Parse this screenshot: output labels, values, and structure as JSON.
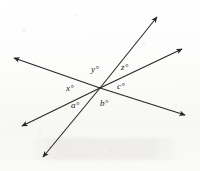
{
  "figure": {
    "background_color": "#fdfdfc",
    "line_color": "#262626",
    "label_color": "#1a1a1a",
    "width": 200,
    "height": 171,
    "vertex": {
      "x": 100,
      "y": 88
    }
  },
  "labels": [
    {
      "id": "x",
      "text": "x°",
      "x": 66,
      "y": 84
    },
    {
      "id": "y",
      "text": "y°",
      "x": 91,
      "y": 65
    },
    {
      "id": "z",
      "text": "z°",
      "x": 121,
      "y": 63
    },
    {
      "id": "c",
      "text": "c°",
      "x": 117,
      "y": 82
    },
    {
      "id": "b",
      "text": "b°",
      "x": 100,
      "y": 99
    },
    {
      "id": "a",
      "text": "a°",
      "x": 71,
      "y": 101
    }
  ],
  "rays": [
    {
      "id": "ray-upper-left",
      "name": "ray-upper-left",
      "x1": 100,
      "y1": 88,
      "x2": 14,
      "y2": 58
    },
    {
      "id": "ray-lower-right",
      "name": "ray-lower-right",
      "x1": 100,
      "y1": 88,
      "x2": 185,
      "y2": 115
    },
    {
      "id": "ray-lower-left",
      "name": "ray-lower-left",
      "x1": 100,
      "y1": 88,
      "x2": 22,
      "y2": 126
    },
    {
      "id": "ray-upper-right",
      "name": "ray-upper-right",
      "x1": 100,
      "y1": 88,
      "x2": 182,
      "y2": 49
    },
    {
      "id": "ray-bottom-left",
      "name": "ray-bottom-left",
      "x1": 100,
      "y1": 88,
      "x2": 43,
      "y2": 157
    },
    {
      "id": "ray-top-right",
      "name": "ray-top-right",
      "x1": 100,
      "y1": 88,
      "x2": 157,
      "y2": 17
    }
  ]
}
